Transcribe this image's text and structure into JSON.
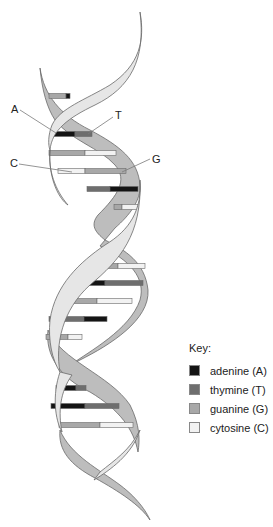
{
  "labels": {
    "a": "A",
    "t": "T",
    "c": "C",
    "g": "G"
  },
  "key": {
    "title": "Key:",
    "items": [
      {
        "name": "adenine (A)",
        "color": "#141414"
      },
      {
        "name": "thymine (T)",
        "color": "#6e6e6e"
      },
      {
        "name": "guanine (G)",
        "color": "#a8a8a8"
      },
      {
        "name": "cytosine (C)",
        "color": "#f2f2f2"
      }
    ]
  },
  "colors": {
    "adenine": "#141414",
    "thymine": "#6e6e6e",
    "guanine": "#a8a8a8",
    "cytosine": "#f2f2f2",
    "backbone_front": "#e6e6e6",
    "backbone_back": "#bdbdbd",
    "outline": "#6a6a6a"
  },
  "base_pairs": [
    {
      "y": 96,
      "left": [
        "G",
        49,
        66
      ],
      "right": [
        "A",
        66,
        70
      ]
    },
    {
      "y": 134,
      "left": [
        "A",
        52,
        75
      ],
      "right": [
        "T",
        75,
        92
      ]
    },
    {
      "y": 153,
      "left": [
        "G",
        49,
        85
      ],
      "right": [
        "C",
        85,
        116
      ]
    },
    {
      "y": 171,
      "left": [
        "C",
        58,
        85
      ],
      "right": [
        "G",
        85,
        126
      ]
    },
    {
      "y": 189,
      "left": [
        "T",
        87,
        110
      ],
      "right": [
        "A",
        110,
        138
      ]
    },
    {
      "y": 207,
      "left": [
        "G",
        114,
        122
      ],
      "right": [
        "C",
        122,
        138
      ]
    },
    {
      "y": 266,
      "left": [
        "G",
        98,
        118
      ],
      "right": [
        "C",
        118,
        145
      ]
    },
    {
      "y": 283,
      "left": [
        "A",
        72,
        105
      ],
      "right": [
        "T",
        105,
        143
      ]
    },
    {
      "y": 301,
      "left": [
        "G",
        59,
        97
      ],
      "right": [
        "C",
        97,
        132
      ]
    },
    {
      "y": 319,
      "left": [
        "T",
        49,
        84
      ],
      "right": [
        "A",
        84,
        107
      ]
    },
    {
      "y": 337,
      "left": [
        "G",
        46,
        68
      ],
      "right": [
        "C",
        68,
        82
      ]
    },
    {
      "y": 388,
      "left": [
        "A",
        56,
        76
      ],
      "right": [
        "T",
        76,
        86
      ]
    },
    {
      "y": 406,
      "left": [
        "A",
        51,
        85
      ],
      "right": [
        "T",
        85,
        119
      ]
    },
    {
      "y": 425,
      "left": [
        "G",
        59,
        100
      ],
      "right": [
        "C",
        100,
        133
      ]
    }
  ]
}
